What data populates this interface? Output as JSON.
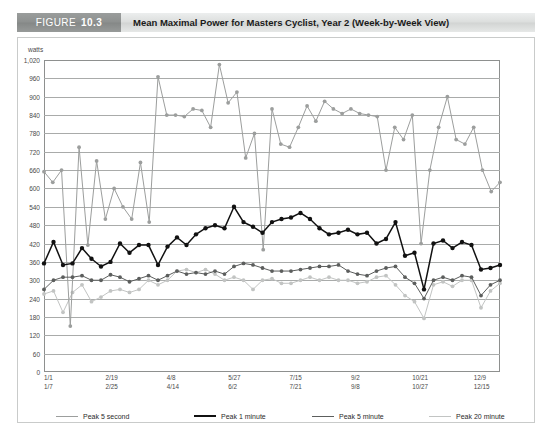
{
  "header": {
    "tag_word": "FIGURE",
    "tag_number": "10.3",
    "title": "Mean Maximal Power for Masters Cyclist, Year 2 (Week-by-Week View)"
  },
  "axis": {
    "unit_label": "watts",
    "y_ticks": [
      "1,020",
      "960",
      "900",
      "840",
      "780",
      "720",
      "660",
      "600",
      "540",
      "480",
      "420",
      "360",
      "300",
      "240",
      "180",
      "120",
      "60",
      "0"
    ],
    "x_ticks": [
      {
        "line1": "1/1",
        "line2": "1/7"
      },
      {
        "line1": "2/19",
        "line2": "2/25"
      },
      {
        "line1": "4/8",
        "line2": "4/14"
      },
      {
        "line1": "5/27",
        "line2": "6/2"
      },
      {
        "line1": "7/15",
        "line2": "7/21"
      },
      {
        "line1": "9/2",
        "line2": "9/8"
      },
      {
        "line1": "10/21",
        "line2": "10/27"
      },
      {
        "line1": "12/9",
        "line2": "12/15"
      }
    ]
  },
  "legend": {
    "items": [
      {
        "label": "Peak 5 second",
        "color": "#9c9e9d"
      },
      {
        "label": "Peak 1 minute",
        "color": "#111111"
      },
      {
        "label": "Peak 5 minute",
        "color": "#5c5e5d"
      },
      {
        "label": "Peak 20 minute",
        "color": "#c2c4c3"
      }
    ]
  },
  "chart_data": {
    "type": "line",
    "title": "Mean Maximal Power for Masters Cyclist, Year 2 (Week-by-Week View)",
    "xlabel": "",
    "ylabel": "watts",
    "ylim": [
      0,
      1020
    ],
    "ytick_step": 60,
    "grid": true,
    "legend_position": "bottom",
    "x_tick_labels": [
      "1/1 1/7",
      "2/19 2/25",
      "4/8 4/14",
      "5/27 6/2",
      "7/15 7/21",
      "9/2 9/8",
      "10/21 10/27",
      "12/9 12/15"
    ],
    "x_tick_indices": [
      0,
      7,
      14,
      21,
      28,
      35,
      42,
      49
    ],
    "n_points": 53,
    "series": [
      {
        "name": "Peak 5 second",
        "color": "#9c9e9d",
        "values": [
          655,
          620,
          660,
          150,
          735,
          415,
          690,
          500,
          600,
          540,
          500,
          685,
          490,
          965,
          840,
          840,
          835,
          860,
          855,
          800,
          1005,
          880,
          915,
          700,
          780,
          400,
          860,
          745,
          735,
          800,
          870,
          820,
          885,
          860,
          845,
          860,
          845,
          840,
          835,
          660,
          800,
          760,
          840,
          420,
          660,
          800,
          900,
          760,
          745,
          800,
          660,
          590,
          620
        ]
      },
      {
        "name": "Peak 1 minute",
        "color": "#111111",
        "values": [
          355,
          425,
          350,
          355,
          405,
          370,
          345,
          360,
          420,
          390,
          415,
          415,
          350,
          410,
          440,
          415,
          450,
          470,
          480,
          470,
          540,
          490,
          475,
          455,
          490,
          500,
          505,
          520,
          500,
          470,
          450,
          455,
          465,
          450,
          455,
          420,
          435,
          490,
          380,
          390,
          270,
          420,
          430,
          405,
          425,
          415,
          335,
          340,
          350
        ]
      },
      {
        "name": "Peak 5 minute",
        "color": "#5c5e5d",
        "values": [
          270,
          300,
          310,
          310,
          315,
          300,
          300,
          318,
          310,
          295,
          305,
          315,
          300,
          315,
          330,
          320,
          325,
          320,
          330,
          320,
          345,
          355,
          350,
          340,
          330,
          330,
          330,
          335,
          340,
          345,
          345,
          350,
          330,
          320,
          315,
          330,
          340,
          345,
          310,
          290,
          240,
          300,
          310,
          300,
          315,
          310,
          250,
          285,
          300
        ]
      },
      {
        "name": "Peak 20 minute",
        "color": "#c2c4c3"
      }
    ],
    "peak20_values": [
      255,
      265,
      195,
      260,
      285,
      230,
      245,
      265,
      270,
      260,
      270,
      300,
      285,
      300,
      330,
      335,
      325,
      335,
      320,
      300,
      310,
      300,
      270,
      300,
      305,
      290,
      290,
      300,
      310,
      300,
      310,
      300,
      300,
      290,
      295,
      310,
      315,
      285,
      250,
      230,
      175,
      285,
      295,
      280,
      300,
      300,
      210,
      265,
      290
    ]
  }
}
